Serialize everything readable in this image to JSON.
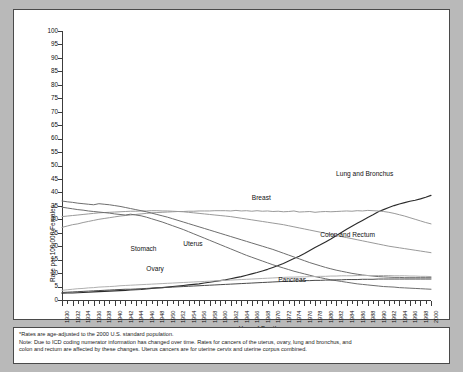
{
  "chart_data": {
    "type": "line",
    "title": "",
    "xlabel": "Year of Death",
    "ylabel": "Rate per 100,000 Females",
    "xlim": [
      1930,
      2000
    ],
    "ylim": [
      0,
      100
    ],
    "ytick_step": 5,
    "xtick_label_step": 2,
    "xtick_minor_step": 1,
    "grid": false,
    "legend_position": "inline-annotations",
    "yticks": [
      0,
      5,
      10,
      15,
      20,
      25,
      30,
      35,
      40,
      45,
      50,
      55,
      60,
      65,
      70,
      75,
      80,
      85,
      90,
      95,
      100
    ],
    "xticks": [
      1930,
      1932,
      1934,
      1936,
      1938,
      1940,
      1942,
      1944,
      1946,
      1948,
      1950,
      1952,
      1954,
      1956,
      1958,
      1960,
      1962,
      1964,
      1966,
      1968,
      1970,
      1972,
      1974,
      1976,
      1978,
      1980,
      1982,
      1984,
      1986,
      1988,
      1990,
      1992,
      1994,
      1996,
      1998,
      2000
    ],
    "x": [
      1930,
      1931,
      1932,
      1933,
      1934,
      1935,
      1936,
      1937,
      1938,
      1939,
      1940,
      1941,
      1942,
      1943,
      1944,
      1945,
      1946,
      1947,
      1948,
      1949,
      1950,
      1951,
      1952,
      1953,
      1954,
      1955,
      1956,
      1957,
      1958,
      1959,
      1960,
      1961,
      1962,
      1963,
      1964,
      1965,
      1966,
      1967,
      1968,
      1969,
      1970,
      1971,
      1972,
      1973,
      1974,
      1975,
      1976,
      1977,
      1978,
      1979,
      1980,
      1981,
      1982,
      1983,
      1984,
      1985,
      1986,
      1987,
      1988,
      1989,
      1990,
      1991,
      1992,
      1993,
      1994,
      1995,
      1996,
      1997,
      1998,
      1999,
      2000
    ],
    "series": [
      {
        "name": "Lung and Bronchus",
        "color": "#2b2b2b",
        "width": 1.15,
        "label_x": 1982,
        "label_y": 47,
        "values": [
          2.5,
          2.6,
          2.6,
          2.7,
          2.8,
          2.9,
          3.0,
          3.1,
          3.2,
          3.3,
          3.4,
          3.5,
          3.6,
          3.7,
          3.8,
          3.9,
          4.1,
          4.3,
          4.5,
          4.6,
          4.8,
          5.0,
          5.2,
          5.4,
          5.6,
          5.8,
          6.0,
          6.3,
          6.6,
          6.9,
          7.2,
          7.5,
          7.9,
          8.3,
          8.7,
          9.2,
          9.7,
          10.2,
          10.8,
          11.4,
          12.1,
          12.8,
          13.6,
          14.5,
          15.4,
          16.3,
          17.3,
          18.4,
          19.5,
          20.5,
          21.6,
          22.7,
          23.9,
          25.1,
          26.3,
          27.4,
          28.5,
          29.6,
          30.7,
          31.7,
          32.8,
          33.6,
          34.4,
          35.1,
          35.7,
          36.2,
          36.7,
          37.1,
          37.6,
          38.2,
          38.9
        ]
      },
      {
        "name": "Breast",
        "color": "#9a9a9a",
        "width": 1.0,
        "label_x": 1966,
        "label_y": 38,
        "values": [
          27.0,
          27.5,
          28.0,
          28.3,
          28.8,
          29.2,
          29.6,
          30.0,
          30.3,
          30.6,
          30.9,
          31.2,
          31.4,
          31.6,
          31.8,
          32.0,
          32.2,
          32.4,
          32.5,
          32.6,
          32.7,
          32.8,
          32.9,
          32.9,
          33.0,
          33.0,
          33.1,
          33.1,
          33.1,
          33.2,
          33.2,
          33.2,
          33.1,
          33.3,
          33.1,
          33.2,
          33.0,
          33.2,
          33.0,
          33.1,
          32.9,
          33.0,
          32.8,
          32.9,
          33.1,
          32.7,
          32.8,
          32.9,
          32.6,
          32.8,
          32.9,
          32.8,
          32.9,
          33.0,
          33.1,
          33.0,
          33.2,
          33.1,
          33.3,
          33.2,
          33.1,
          32.9,
          32.6,
          32.2,
          31.7,
          31.2,
          30.6,
          30.0,
          29.4,
          28.8,
          28.3
        ]
      },
      {
        "name": "Colon and Rectum",
        "color": "#9a9a9a",
        "width": 1.0,
        "label_x": 1979,
        "label_y": 24,
        "values": [
          31.0,
          31.2,
          31.4,
          31.6,
          31.8,
          32.0,
          32.2,
          32.4,
          32.5,
          32.6,
          32.7,
          32.8,
          32.9,
          33.0,
          33.0,
          33.1,
          33.1,
          33.2,
          33.2,
          33.1,
          33.1,
          33.0,
          32.9,
          32.8,
          32.6,
          32.4,
          32.2,
          32.0,
          31.8,
          31.6,
          31.4,
          31.2,
          31.0,
          30.7,
          30.4,
          30.1,
          29.8,
          29.5,
          29.2,
          28.9,
          28.6,
          28.3,
          28.0,
          27.6,
          27.2,
          26.8,
          26.4,
          26.0,
          25.6,
          25.2,
          24.8,
          24.4,
          24.0,
          23.6,
          23.2,
          22.8,
          22.4,
          22.0,
          21.6,
          21.2,
          20.8,
          20.4,
          20.0,
          19.7,
          19.4,
          19.1,
          18.8,
          18.5,
          18.2,
          17.9,
          17.6
        ]
      },
      {
        "name": "Uterus",
        "color": "#6e6e6e",
        "width": 1.0,
        "label_x": 1953,
        "label_y": 21,
        "values": [
          36.8,
          36.5,
          36.3,
          36.0,
          35.8,
          35.6,
          35.4,
          35.8,
          35.6,
          35.4,
          35.1,
          34.8,
          34.4,
          34.0,
          33.6,
          33.2,
          32.8,
          32.3,
          31.8,
          31.3,
          30.8,
          30.2,
          29.6,
          29.0,
          28.4,
          27.8,
          27.2,
          26.6,
          26.0,
          25.4,
          24.8,
          24.2,
          23.6,
          23.0,
          22.4,
          21.8,
          21.2,
          20.6,
          20.0,
          19.4,
          18.8,
          18.1,
          17.4,
          16.7,
          16.0,
          15.3,
          14.6,
          13.9,
          13.3,
          12.7,
          12.1,
          11.6,
          11.1,
          10.7,
          10.3,
          9.9,
          9.6,
          9.3,
          9.1,
          8.9,
          8.7,
          8.6,
          8.5,
          8.4,
          8.4,
          8.3,
          8.3,
          8.3,
          8.3,
          8.3,
          8.3
        ]
      },
      {
        "name": "Stomach",
        "color": "#6e6e6e",
        "width": 1.0,
        "label_x": 1943,
        "label_y": 19,
        "values": [
          34.5,
          34.2,
          33.9,
          33.6,
          33.4,
          33.1,
          32.9,
          32.7,
          32.5,
          32.3,
          32.0,
          31.8,
          31.6,
          31.9,
          31.6,
          31.3,
          30.8,
          30.2,
          29.6,
          29.0,
          28.3,
          27.6,
          26.9,
          26.2,
          25.4,
          24.6,
          23.8,
          23.0,
          22.2,
          21.4,
          20.6,
          19.8,
          19.0,
          18.2,
          17.4,
          16.6,
          15.9,
          15.2,
          14.5,
          13.8,
          13.1,
          12.5,
          11.9,
          11.3,
          10.7,
          10.2,
          9.7,
          9.2,
          8.7,
          8.3,
          7.9,
          7.5,
          7.2,
          6.9,
          6.6,
          6.3,
          6.0,
          5.8,
          5.6,
          5.4,
          5.2,
          5.0,
          4.9,
          4.8,
          4.6,
          4.5,
          4.4,
          4.3,
          4.2,
          4.1,
          4.0
        ]
      },
      {
        "name": "Ovary",
        "color": "#b0b0b0",
        "width": 1.0,
        "label_x": 1946,
        "label_y": 11.5,
        "values": [
          3.6,
          3.8,
          4.0,
          4.2,
          4.3,
          4.5,
          4.6,
          4.8,
          4.9,
          5.0,
          5.1,
          5.3,
          5.4,
          5.5,
          5.6,
          5.7,
          5.8,
          5.9,
          6.0,
          6.1,
          6.2,
          6.3,
          6.4,
          6.5,
          6.6,
          6.7,
          6.8,
          6.9,
          7.0,
          7.1,
          7.2,
          7.3,
          7.4,
          7.5,
          7.6,
          7.7,
          7.8,
          7.9,
          8.0,
          8.1,
          8.2,
          8.3,
          8.4,
          8.5,
          8.5,
          8.6,
          8.6,
          8.7,
          8.7,
          8.8,
          8.8,
          8.9,
          8.9,
          9.0,
          9.0,
          9.0,
          9.1,
          9.1,
          9.1,
          9.1,
          9.1,
          9.1,
          9.1,
          9.0,
          9.0,
          9.0,
          8.9,
          8.9,
          8.8,
          8.8,
          8.7
        ]
      },
      {
        "name": "Pancreas",
        "color": "#4a4a4a",
        "width": 1.0,
        "label_x": 1971,
        "label_y": 7.6,
        "values": [
          2.8,
          2.9,
          3.0,
          3.1,
          3.2,
          3.3,
          3.4,
          3.5,
          3.6,
          3.7,
          3.8,
          3.9,
          4.0,
          4.0,
          4.1,
          4.2,
          4.3,
          4.4,
          4.5,
          4.6,
          4.7,
          4.8,
          4.9,
          5.0,
          5.1,
          5.2,
          5.3,
          5.4,
          5.5,
          5.6,
          5.7,
          5.8,
          5.9,
          6.0,
          6.1,
          6.2,
          6.3,
          6.4,
          6.5,
          6.6,
          6.7,
          6.8,
          6.9,
          6.9,
          7.0,
          7.1,
          7.2,
          7.2,
          7.3,
          7.3,
          7.4,
          7.4,
          7.5,
          7.5,
          7.6,
          7.6,
          7.6,
          7.7,
          7.7,
          7.7,
          7.8,
          7.8,
          7.8,
          7.8,
          7.8,
          7.8,
          7.8,
          7.8,
          7.8,
          7.8,
          7.8
        ]
      }
    ]
  },
  "footnote": {
    "line1": "*Rates are age-adjusted to the 2000 U.S. standard population.",
    "line2": "Note: Due to ICD coding numerator information has changed over time. Rates for cancers of the uterus, ovary, lung and bronchus, and",
    "line3": "colon and rectum are affected by these changes. Uterus cancers are for uterine cervix and uterine corpus combined."
  }
}
